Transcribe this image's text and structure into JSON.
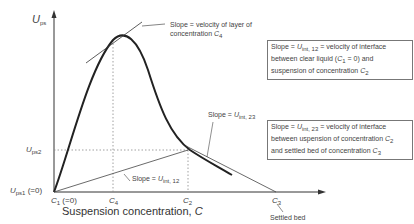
{
  "diagram": {
    "y_axis": {
      "symbol": "U",
      "sub": "ps"
    },
    "y_ticks": [
      {
        "symbol": "U",
        "sub": "ps2",
        "suffix": ""
      },
      {
        "symbol": "U",
        "sub": "ps1",
        "suffix": " (=0)"
      }
    ],
    "x_ticks": [
      {
        "symbol": "C",
        "sub": "1",
        "suffix": " (=0)"
      },
      {
        "symbol": "C",
        "sub": "4",
        "suffix": ""
      },
      {
        "symbol": "C",
        "sub": "2",
        "suffix": ""
      },
      {
        "symbol": "C",
        "sub": "3",
        "suffix": ""
      }
    ],
    "x_title": "Suspension concentration, ",
    "x_title_symbol": "C",
    "annotations": {
      "tangent": {
        "line1": "Slope = velocity of layer of",
        "line2": "concentration ",
        "sym": "C",
        "sub": "4"
      },
      "slope12": {
        "prefix": "Slope = ",
        "sym": "U",
        "sub": "int, 12"
      },
      "slope23": {
        "prefix": "Slope = ",
        "sym": "U",
        "sub": "int, 23"
      },
      "settled": "Settled bed"
    },
    "boxes": {
      "box1": {
        "l1a": "Slope = ",
        "l1sym": "U",
        "l1sub": "int, 12",
        "l1b": " = velocity of interface",
        "l2a": "between clear liquid (",
        "l2sym": "C",
        "l2sub": "1",
        "l2b": " = 0) and",
        "l3a": "suspension of concentration ",
        "l3sym": "C",
        "l3sub": "2"
      },
      "box2": {
        "l1a": "Slope = ",
        "l1sym": "U",
        "l1sub": "int, 23",
        "l1b": " = velocity of interface",
        "l2a": "between  uspension of concentration ",
        "l2sym": "C",
        "l2sub": "2",
        "l3a": "and settled bed of concentration ",
        "l3sym": "C",
        "l3sub": "3"
      }
    }
  }
}
